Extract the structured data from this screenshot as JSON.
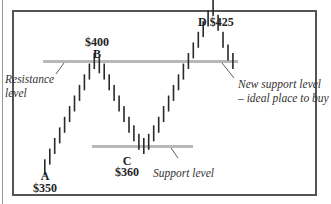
{
  "chart_data": {
    "type": "bar",
    "subtype": "price-bars (OHLC-style vertical ticks)",
    "title": "",
    "xlabel": "",
    "ylabel": "",
    "grid": false,
    "legend": null,
    "points": [
      {
        "label": "A",
        "price": "$350",
        "value": 350
      },
      {
        "label": "B",
        "price": "$400",
        "value": 400
      },
      {
        "label": "C",
        "price": "$360",
        "value": 360
      },
      {
        "label": "D",
        "price": "$425",
        "value": 425
      }
    ],
    "levels": [
      {
        "name": "Resistance level",
        "value": 400
      },
      {
        "name": "Support level",
        "value": 360
      },
      {
        "name": "New support level – ideal place to buy",
        "value": 400
      }
    ],
    "series": [
      {
        "name": "price",
        "path": "A→B→C→D→pullback",
        "values": [
          350,
          355,
          360,
          365,
          370,
          375,
          380,
          385,
          390,
          395,
          400,
          398,
          395,
          390,
          385,
          380,
          375,
          370,
          366,
          362,
          360,
          362,
          366,
          370,
          375,
          380,
          385,
          390,
          395,
          400,
          405,
          410,
          415,
          420,
          425,
          418,
          410,
          404,
          400
        ]
      }
    ]
  },
  "annotations": {
    "point_a_letter": "A",
    "point_a_price": "$350",
    "point_b_letter": "B",
    "point_b_price": "$400",
    "point_c_letter": "C",
    "point_c_price": "$360",
    "point_d": "D $425",
    "resistance_line1": "Resistance",
    "resistance_line2": "level",
    "support": "Support level",
    "new_support_line1": "New support level",
    "new_support_line2": "– ideal place to buy"
  },
  "colors": {
    "frame": "#555555",
    "bars": "#2a2a2a",
    "level_lines": "#b8b8b8",
    "text": "#222222"
  }
}
